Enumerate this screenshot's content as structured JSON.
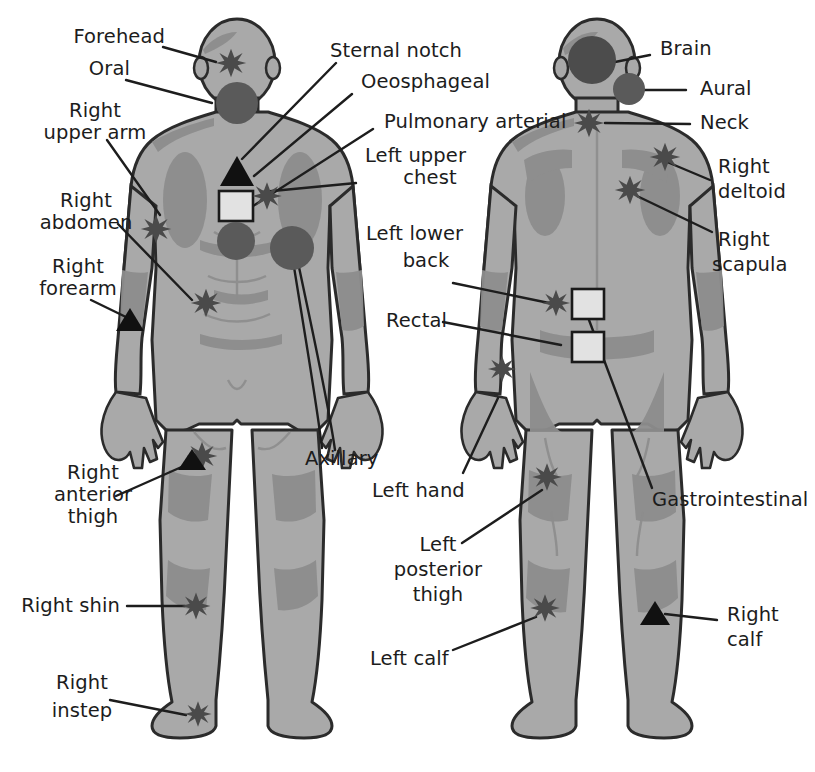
{
  "diagram": {
    "views": [
      {
        "name": "anterior",
        "caption": "Front view figure"
      },
      {
        "name": "posterior",
        "caption": "Back view figure"
      }
    ],
    "colors": {
      "background": "#ffffff",
      "body_fill": "#a9a9a9",
      "body_shade": "#8d8d8d",
      "body_outline": "#2b2b2b",
      "marker_dark": "#4a4a4a",
      "marker_black": "#111111",
      "marker_square_fill": "#e2e2e2",
      "leader_line": "#1d1d1d",
      "text": "#1c1c1c"
    },
    "marker_types": [
      {
        "shape": "star",
        "name": "star-marker",
        "fill": "#4a4a4a"
      },
      {
        "shape": "circle",
        "name": "circle-marker",
        "fill": "#5a5a5a"
      },
      {
        "shape": "triangle",
        "name": "triangle-marker",
        "fill": "#111111"
      },
      {
        "shape": "square",
        "name": "square-marker",
        "fill": "#e2e2e2"
      }
    ],
    "labels_left": [
      {
        "id": "forehead",
        "text": "Forehead",
        "marker": "star"
      },
      {
        "id": "oral",
        "text": "Oral",
        "marker": "circle"
      },
      {
        "id": "right-upper-arm",
        "text": "Right\nupper arm",
        "marker": "star"
      },
      {
        "id": "right-abdomen",
        "text": "Right\nabdomen",
        "marker": "star"
      },
      {
        "id": "right-forearm",
        "text": "Right\nforearm",
        "marker": "triangle"
      },
      {
        "id": "right-anterior-thigh",
        "text": "Right\nanterior\nthigh",
        "marker": "triangle"
      },
      {
        "id": "right-shin",
        "text": "Right shin",
        "marker": "star"
      },
      {
        "id": "right-instep",
        "text": "Right\ninstep",
        "marker": "star"
      }
    ],
    "labels_center": [
      {
        "id": "sternal-notch",
        "text": "Sternal notch",
        "marker": "triangle"
      },
      {
        "id": "oeosphageal",
        "text": "Oeosphageal",
        "marker": "square"
      },
      {
        "id": "pulmonary-arterial",
        "text": "Pulmonary arterial",
        "marker": "circle"
      },
      {
        "id": "left-upper-chest",
        "text": "Left upper\nchest",
        "marker": "star"
      },
      {
        "id": "axillary",
        "text": "Axillary",
        "marker": "circle"
      },
      {
        "id": "left-lower-back",
        "text": "Left lower\nback",
        "marker": "star"
      },
      {
        "id": "rectal",
        "text": "Rectal",
        "marker": "square"
      },
      {
        "id": "left-hand",
        "text": "Left hand",
        "marker": "star"
      },
      {
        "id": "left-posterior-thigh",
        "text": "Left\nposterior\nthigh",
        "marker": "star"
      },
      {
        "id": "left-calf",
        "text": "Left calf",
        "marker": "star"
      }
    ],
    "labels_right": [
      {
        "id": "brain",
        "text": "Brain",
        "marker": "circle"
      },
      {
        "id": "aural",
        "text": "Aural",
        "marker": "circle"
      },
      {
        "id": "neck",
        "text": "Neck",
        "marker": "star"
      },
      {
        "id": "right-deltoid",
        "text": "Right\ndeltoid",
        "marker": "star"
      },
      {
        "id": "right-scapula",
        "text": "Right\nscapula",
        "marker": "star"
      },
      {
        "id": "gastrointestinal",
        "text": "Gastrointestinal",
        "marker": "square"
      },
      {
        "id": "right-calf",
        "text": "Right\ncalf",
        "marker": "triangle"
      }
    ],
    "label_text": {
      "forehead": "Forehead",
      "oral": "Oral",
      "right_upper_arm_1": "Right",
      "right_upper_arm_2": "upper arm",
      "right_abdomen_1": "Right",
      "right_abdomen_2": "abdomen",
      "right_forearm_1": "Right",
      "right_forearm_2": "forearm",
      "right_anterior_thigh_1": "Right",
      "right_anterior_thigh_2": "anterior",
      "right_anterior_thigh_3": "thigh",
      "right_shin": "Right shin",
      "right_instep_1": "Right",
      "right_instep_2": "instep",
      "sternal_notch": "Sternal notch",
      "oeosphageal": "Oeosphageal",
      "pulmonary_arterial": "Pulmonary arterial",
      "left_upper_chest_1": "Left upper",
      "left_upper_chest_2": "chest",
      "axillary": "Axillary",
      "left_lower_back_1": "Left lower",
      "left_lower_back_2": "back",
      "rectal": "Rectal",
      "left_hand": "Left hand",
      "left_posterior_thigh_1": "Left",
      "left_posterior_thigh_2": "posterior",
      "left_posterior_thigh_3": "thigh",
      "left_calf": "Left calf",
      "brain": "Brain",
      "aural": "Aural",
      "neck": "Neck",
      "right_deltoid_1": "Right",
      "right_deltoid_2": "deltoid",
      "right_scapula_1": "Right",
      "right_scapula_2": "scapula",
      "gastrointestinal": "Gastrointestinal",
      "right_calf_1": "Right",
      "right_calf_2": "calf"
    }
  }
}
